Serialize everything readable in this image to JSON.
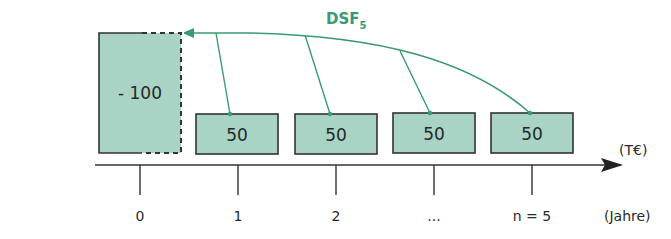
{
  "diagram": {
    "title_fragment": "",
    "discount_label": {
      "main": "DSF",
      "subscript": "5"
    },
    "initial_payment": {
      "period": "0",
      "value": "- 100"
    },
    "cash_flows": [
      {
        "period": "1",
        "value": "50"
      },
      {
        "period": "2",
        "value": "50"
      },
      {
        "period": "...",
        "value": "50"
      },
      {
        "period": "n = 5",
        "value": "50"
      }
    ],
    "axis": {
      "tick_labels": [
        "0",
        "1",
        "2",
        "...",
        "n = 5"
      ],
      "unit_label": "(T€)",
      "time_unit_label": "(Jahre)"
    },
    "colors": {
      "box_fill": "#a9d3c4",
      "box_border": "#333333",
      "arrow_green": "#3a9a74",
      "axis": "#333333"
    }
  }
}
